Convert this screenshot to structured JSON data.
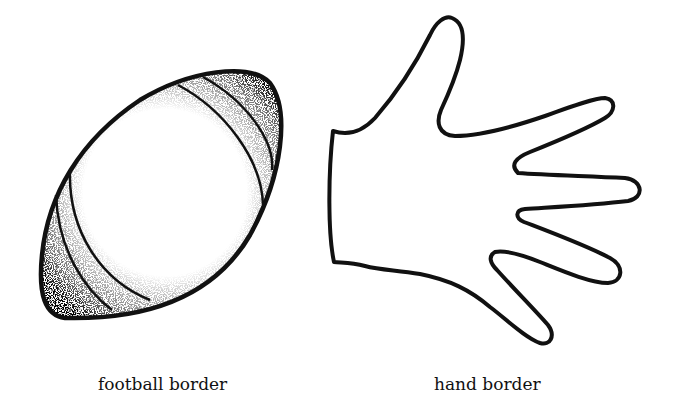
{
  "figures": [
    {
      "id": "football",
      "caption": "football border",
      "icon": "football-icon"
    },
    {
      "id": "hand",
      "caption": "hand border",
      "icon": "hand-icon"
    }
  ],
  "colors": {
    "ink": "#111111",
    "background": "#ffffff"
  }
}
